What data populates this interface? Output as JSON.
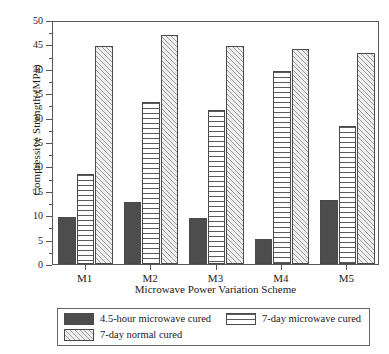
{
  "chart_data": {
    "type": "bar",
    "title": "",
    "xlabel": "Microwave Power Variation Scheme",
    "ylabel": "Compressive Strength (MPa)",
    "categories": [
      "M1",
      "M2",
      "M3",
      "M4",
      "M5"
    ],
    "ylim": [
      0,
      50
    ],
    "yticks": [
      0,
      5,
      10,
      15,
      20,
      25,
      30,
      35,
      40,
      45,
      50
    ],
    "ytick_labels": [
      "0",
      "5",
      "10",
      "15",
      "20",
      "25",
      "30",
      "35",
      "40",
      "45",
      "50"
    ],
    "grid": false,
    "legend_position": "below-axes",
    "series": [
      {
        "name": "4.5-hour microwave cured",
        "fill": "solid",
        "color": "#4d4d4d",
        "values": [
          9.6,
          12.8,
          9.5,
          5.1,
          13.1
        ]
      },
      {
        "name": "7-day microwave cured",
        "fill": "horizontal-lines",
        "color": "#ffffff",
        "values": [
          18.4,
          33.2,
          31.6,
          39.6,
          28.2
        ]
      },
      {
        "name": "7-day normal cured",
        "fill": "diagonal-hatch",
        "color": "#efefef",
        "values": [
          44.6,
          46.9,
          44.6,
          44.1,
          43.2
        ]
      }
    ]
  },
  "axes": {
    "ylabel": "Compressive Strength (MPa)",
    "xlabel": "Microwave Power Variation Scheme"
  },
  "legend": {
    "entries": [
      {
        "label": "4.5-hour microwave cured",
        "fill": "solid"
      },
      {
        "label": "7-day microwave cured",
        "fill": "horizontal-lines"
      },
      {
        "label": "7-day normal cured",
        "fill": "diagonal-hatch"
      }
    ]
  },
  "colors": {
    "series_1": "#4d4d4d",
    "series_2": "#ffffff",
    "series_3": "#efefef",
    "axis": "#555555",
    "background": "#ffffff"
  }
}
